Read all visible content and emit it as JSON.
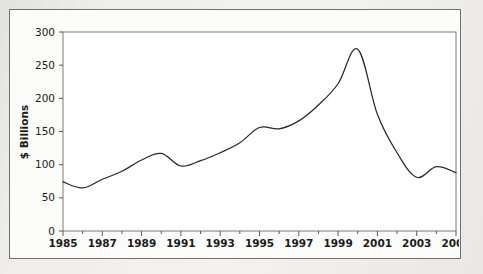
{
  "chart_data": {
    "type": "line",
    "title": "",
    "xlabel": "",
    "ylabel": "$ Billions",
    "xlim": [
      1985,
      2005
    ],
    "ylim": [
      0,
      300
    ],
    "grid": false,
    "legend": null,
    "line_color": "#2a2a2a",
    "x": [
      1985,
      1986,
      1987,
      1988,
      1989,
      1990,
      1991,
      1992,
      1993,
      1994,
      1995,
      1996,
      1997,
      1998,
      1999,
      2000,
      2001,
      2002,
      2003,
      2004,
      2005
    ],
    "values": [
      74,
      65,
      78,
      90,
      107,
      117,
      98,
      106,
      118,
      133,
      156,
      154,
      166,
      190,
      222,
      274,
      176,
      118,
      81,
      97,
      88
    ],
    "y_ticks": [
      0,
      50,
      100,
      150,
      200,
      250,
      300
    ],
    "y_tick_labels": [
      "0",
      "50",
      "100",
      "150",
      "200",
      "250",
      "300"
    ],
    "x_major_ticks": [
      1985,
      1987,
      1989,
      1991,
      1993,
      1995,
      1997,
      1999,
      2001,
      2003,
      2005
    ],
    "x_major_tick_labels": [
      "1985",
      "1987",
      "1989",
      "1991",
      "1993",
      "1995",
      "1997",
      "1999",
      "2001",
      "2003",
      "2005"
    ],
    "x_minor_ticks": [
      1986,
      1988,
      1990,
      1992,
      1994,
      1996,
      1998,
      2000,
      2002,
      2004
    ]
  },
  "figure": {
    "frame_border_color": "#6f6f6f",
    "plot_background": "#ffffff",
    "page_background": "#eeeeec",
    "axis_color": "#5a5a5a"
  }
}
